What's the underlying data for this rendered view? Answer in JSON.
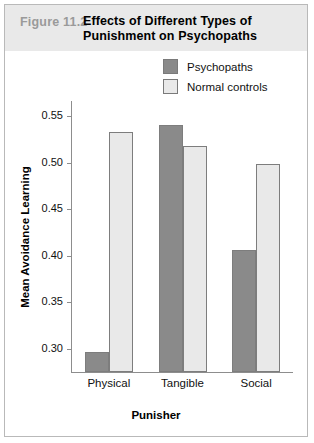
{
  "figure": {
    "number": "Figure 11.2",
    "title": "Effects of Different Types of Punishment on Psychopaths"
  },
  "legend": {
    "position": "top-right",
    "entries": [
      {
        "label": "Psychopaths",
        "color": "#8a8a8a"
      },
      {
        "label": "Normal controls",
        "color": "#e9e9e9"
      }
    ]
  },
  "axes": {
    "y_ticks": [
      "0.30",
      "0.35",
      "0.40",
      "0.45",
      "0.50",
      "0.55"
    ],
    "y_title": "Mean Avoidance Learning",
    "x_title": "Punisher"
  },
  "chart_data": {
    "type": "bar",
    "title": "Effects of Different Types of Punishment on Psychopaths",
    "xlabel": "Punisher",
    "ylabel": "Mean Avoidance Learning",
    "categories": [
      "Physical",
      "Tangible",
      "Social"
    ],
    "series": [
      {
        "name": "Psychopaths",
        "color": "#8a8a8a",
        "values": [
          0.297,
          0.541,
          0.406
        ]
      },
      {
        "name": "Normal controls",
        "color": "#e9e9e9",
        "values": [
          0.533,
          0.518,
          0.499
        ]
      }
    ],
    "ylim": [
      0.275,
      0.5665
    ],
    "ytick_values": [
      0.3,
      0.35,
      0.4,
      0.45,
      0.5,
      0.55
    ],
    "grid": false,
    "legend_position": "top-right"
  }
}
